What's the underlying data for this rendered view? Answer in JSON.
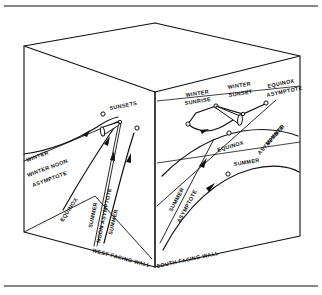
{
  "figure": {
    "kind": "isometric-room-solar-path-diagram",
    "ink_color": "#111111",
    "background_color": "#ffffff",
    "frame": {
      "top_rule": true,
      "bottom_rule": true
    }
  },
  "walls": {
    "west": {
      "label": "WEST FACING WALL"
    },
    "south": {
      "label": "SOUTH FACING WALL"
    }
  },
  "west_wall_labels": {
    "sunsets": "SUNSETS",
    "winter": "WINTER",
    "winter_noon_asymptote_line1": "WINTER NOON",
    "winter_noon_asymptote_line2": "ASYMPTOTE",
    "equinox": "EQUINOX",
    "summer_noon_asymptote_line1": "SUMMER",
    "summer_noon_asymptote_line2": "NOON ASYMPTOTE",
    "summer": "SUMMER"
  },
  "south_wall_labels": {
    "winter_sunrise_line1": "WINTER",
    "winter_sunrise_line2": "SUNRISE",
    "winter_sunset_line1": "WINTER",
    "winter_sunset_line2": "SUNSET",
    "equinox_asymptote_line1": "EQUINOX",
    "equinox_asymptote_line2": "ASYMPTOTE",
    "equinox": "EQUINOX",
    "summer_asymptote_right_line1": "SUMMER",
    "summer_asymptote_right_line2": "ASYMPTOTE",
    "summer": "SUMMER",
    "summer_asymptote_left_line1": "SUMMER",
    "summer_asymptote_left_line2": "ASYMPTOTE"
  }
}
